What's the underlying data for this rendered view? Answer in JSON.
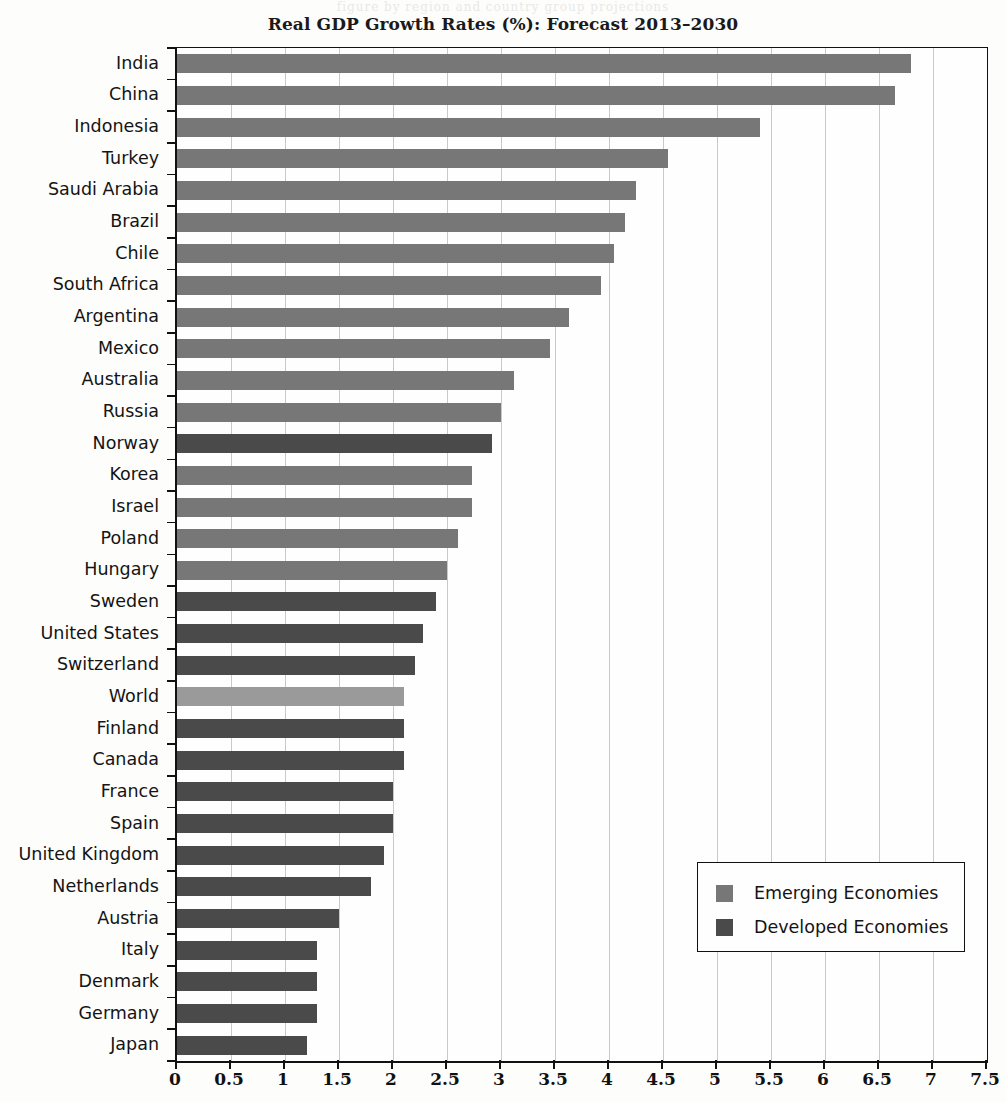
{
  "page": {
    "ghost_text": "figure  by  region  and  country  group  projections"
  },
  "chart_data": {
    "type": "bar",
    "orientation": "horizontal",
    "title": "Real GDP Growth Rates (%): Forecast 2013–2030",
    "xlabel": "",
    "ylabel": "",
    "xlim": [
      0,
      7.5
    ],
    "xticks": [
      0,
      0.5,
      1,
      1.5,
      2,
      2.5,
      3,
      3.5,
      4,
      4.5,
      5,
      5.5,
      6,
      6.5,
      7,
      7.5
    ],
    "xtick_labels": [
      "0",
      "0.5",
      "1",
      "1.5",
      "2",
      "2.5",
      "3",
      "3.5",
      "4",
      "4.5",
      "5",
      "5.5",
      "6",
      "6.5",
      "7",
      "7.5"
    ],
    "grid": "vertical",
    "legend": {
      "position": "bottom-right",
      "entries": [
        {
          "name": "Emerging Economies",
          "color": "#777777",
          "key": "emerging"
        },
        {
          "name": "Developed Economies",
          "color": "#4a4a4a",
          "key": "developed"
        }
      ]
    },
    "colors": {
      "emerging": "#777777",
      "developed": "#4a4a4a",
      "world": "#9a9a9a"
    },
    "categories": [
      "India",
      "China",
      "Indonesia",
      "Turkey",
      "Saudi Arabia",
      "Brazil",
      "Chile",
      "South Africa",
      "Argentina",
      "Mexico",
      "Australia",
      "Russia",
      "Norway",
      "Korea",
      "Israel",
      "Poland",
      "Hungary",
      "Sweden",
      "United States",
      "Switzerland",
      "World",
      "Finland",
      "Canada",
      "France",
      "Spain",
      "United Kingdom",
      "Netherlands",
      "Austria",
      "Italy",
      "Denmark",
      "Germany",
      "Japan"
    ],
    "values": [
      6.8,
      6.65,
      5.4,
      4.55,
      4.25,
      4.15,
      4.05,
      3.93,
      3.63,
      3.45,
      3.12,
      3.0,
      2.92,
      2.73,
      2.73,
      2.6,
      2.5,
      2.4,
      2.28,
      2.2,
      2.1,
      2.1,
      2.1,
      2.0,
      2.0,
      1.92,
      1.8,
      1.5,
      1.3,
      1.3,
      1.3,
      1.2
    ],
    "groups": [
      "emerging",
      "emerging",
      "emerging",
      "emerging",
      "emerging",
      "emerging",
      "emerging",
      "emerging",
      "emerging",
      "emerging",
      "emerging",
      "emerging",
      "developed",
      "emerging",
      "emerging",
      "emerging",
      "emerging",
      "developed",
      "developed",
      "developed",
      "world",
      "developed",
      "developed",
      "developed",
      "developed",
      "developed",
      "developed",
      "developed",
      "developed",
      "developed",
      "developed",
      "developed"
    ]
  }
}
